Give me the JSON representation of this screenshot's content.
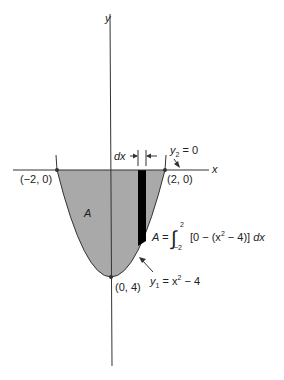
{
  "diagram": {
    "axes": {
      "x_label": "x",
      "y_label": "y"
    },
    "points": {
      "left": "(−2, 0)",
      "right": "(2, 0)",
      "vertex": "(0, 4)"
    },
    "region_label": "A",
    "dx_label": "dx",
    "curves": {
      "y2": {
        "name": "y",
        "sub": "2",
        "rest": " = 0"
      },
      "y1": {
        "name": "y",
        "sub": "1",
        "rest": " = x",
        "exp": "2",
        "tail": " − 4"
      }
    },
    "integral": {
      "lhs": "A = ",
      "sign": "∫",
      "upper": "2",
      "lower": "−2",
      "body_a": "[0 − (x",
      "exp": "2",
      "body_b": " − 4)] ",
      "dx": "dx"
    },
    "colors": {
      "fill": "#a9a9a9",
      "strip": "#000000",
      "line": "#333333"
    }
  }
}
